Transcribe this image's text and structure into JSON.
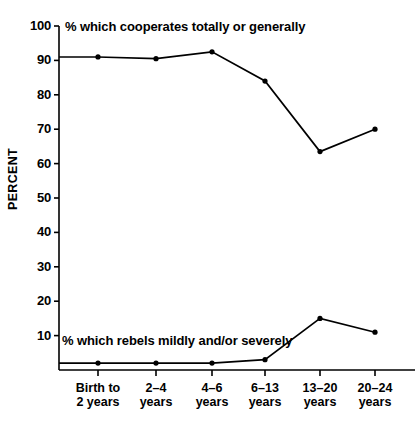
{
  "axes": {
    "y_title": "PERCENT",
    "y_ticks": [
      "100",
      "90",
      "80",
      "70",
      "60",
      "50",
      "40",
      "30",
      "20",
      "10"
    ],
    "y_tick_values": [
      100,
      90,
      80,
      70,
      60,
      50,
      40,
      30,
      20,
      10
    ]
  },
  "annotations": {
    "cooperates": "% which cooperates totally or generally",
    "rebels": "% which rebels mildly and/or severely"
  },
  "categories_display": [
    {
      "line1": "Birth to",
      "line2": "2 years"
    },
    {
      "line1": "2–4",
      "line2": "years"
    },
    {
      "line1": "4–6",
      "line2": "years"
    },
    {
      "line1": "6–13",
      "line2": "years"
    },
    {
      "line1": "13–20",
      "line2": "years"
    },
    {
      "line1": "20–24",
      "line2": "years"
    }
  ],
  "chart_data": {
    "type": "line",
    "title": "",
    "xlabel": "",
    "ylabel": "PERCENT",
    "ylim": [
      0,
      100
    ],
    "ytick_step": 10,
    "grid": false,
    "legend": "inline annotations",
    "categories": [
      "Birth to 2 years",
      "2–4 years",
      "4–6 years",
      "6–13 years",
      "13–20 years",
      "20–24 years"
    ],
    "series": [
      {
        "name": "% which cooperates totally or generally",
        "values": [
          91,
          90.5,
          92.5,
          84,
          63.5,
          70
        ],
        "color": "#000000",
        "marker": "filled-circle"
      },
      {
        "name": "% which rebels mildly and/or severely",
        "values": [
          2,
          2,
          2,
          3,
          15,
          11
        ],
        "color": "#000000",
        "marker": "filled-circle"
      }
    ],
    "axis_origin_value": 2
  }
}
